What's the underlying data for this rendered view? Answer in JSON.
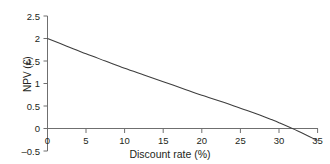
{
  "chart_data": {
    "type": "line",
    "title": "NPV AGAINST THE DISCOUNT RATE",
    "xlabel": "Discount rate (%)",
    "ylabel": "NPV (€)",
    "xlim": [
      0,
      35
    ],
    "ylim": [
      -0.5,
      2.5
    ],
    "xticks": [
      "0",
      "5",
      "10",
      "15",
      "20",
      "25",
      "30",
      "35"
    ],
    "xtick_values": [
      0,
      5,
      10,
      15,
      20,
      25,
      30,
      35
    ],
    "yticks": [
      "2.5",
      "2",
      "1.5",
      "1",
      "0.5",
      "0",
      "–0.5"
    ],
    "ytick_values": [
      2.5,
      2,
      1.5,
      1,
      0.5,
      0,
      -0.5
    ],
    "grid": false,
    "legend": null,
    "series": [
      {
        "name": "NPV",
        "color": "#3d3d3d",
        "x": [
          0,
          2.5,
          5,
          7.5,
          10,
          12.5,
          15,
          17.5,
          20,
          22.5,
          25,
          27.5,
          29,
          30,
          32.5,
          35
        ],
        "values": [
          2.0,
          1.83,
          1.66,
          1.5,
          1.34,
          1.19,
          1.04,
          0.89,
          0.74,
          0.6,
          0.45,
          0.3,
          0.2,
          0.13,
          -0.06,
          -0.27
        ]
      }
    ],
    "annotations": [
      {
        "label": "zero-crossing (IRR)",
        "x": 29,
        "y": 0
      }
    ]
  },
  "axis_style": {
    "line_color": "#6f6f6f",
    "curve_color": "#3d3d3d",
    "background": "#ffffff"
  }
}
